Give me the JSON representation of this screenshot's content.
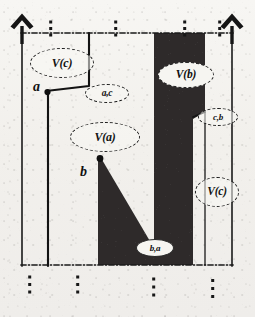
{
  "figure": {
    "background_color": "#f2f0ec",
    "ink_color": "#1a1a1a",
    "fill_color": "#2e2c2b"
  },
  "regions": [
    {
      "id": "v-c-upper-left",
      "label": "V(c)"
    },
    {
      "id": "v-b",
      "label": "V(b)"
    },
    {
      "id": "v-a",
      "label": "V(a)"
    },
    {
      "id": "v-c-lower-right",
      "label": "V(c)"
    }
  ],
  "edges": [
    {
      "id": "edge-ac",
      "label": "a,c"
    },
    {
      "id": "edge-cb",
      "label": "c,b"
    },
    {
      "id": "edge-ba",
      "label": "b,a"
    }
  ],
  "sites": [
    {
      "id": "site-a",
      "label": "a"
    },
    {
      "id": "site-b",
      "label": "b"
    }
  ],
  "axes": {
    "left_arrow": "up-arrow",
    "right_arrow": "up-arrow"
  },
  "markers": {
    "top": [
      "vertical-dots",
      "vertical-dots",
      "vertical-dots",
      "vertical-dots"
    ],
    "bottom": [
      "vertical-dots",
      "vertical-dots",
      "vertical-dots",
      "vertical-dots"
    ]
  }
}
